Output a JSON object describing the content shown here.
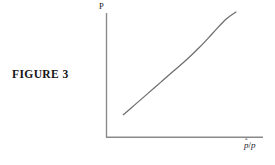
{
  "figure": {
    "caption": "FIGURE 3"
  },
  "chart_data": {
    "type": "line",
    "title": "",
    "subtitle": "",
    "xlabel": "p̂/p",
    "xlabel_parts": {
      "numerator": "p",
      "accent": "ˆ",
      "separator": "/",
      "denominator": "p"
    },
    "ylabel": "P",
    "grid": false,
    "legend": null,
    "axis_ticks": [],
    "tick_labels": {
      "x": [],
      "y": []
    },
    "xlim": [
      0,
      1
    ],
    "ylim": [
      0,
      1
    ],
    "axis_color": "#8a8a8a",
    "curve_color": "#6e6e6e",
    "series": [
      {
        "name": "supply-curve",
        "description": "monotonically increasing convex curve",
        "x": [
          0.13,
          0.22,
          0.32,
          0.42,
          0.52,
          0.62,
          0.72,
          0.82,
          0.92,
          1.0
        ],
        "y": [
          0.18,
          0.26,
          0.35,
          0.44,
          0.53,
          0.62,
          0.72,
          0.83,
          0.94,
          1.0
        ]
      }
    ],
    "annotations": []
  }
}
